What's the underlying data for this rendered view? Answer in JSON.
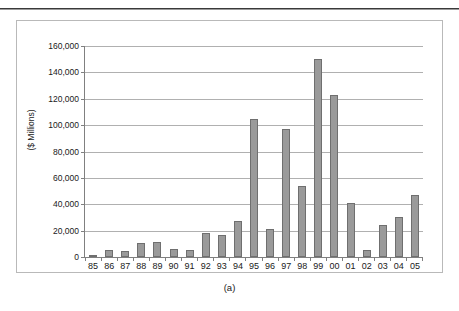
{
  "caption": "(a)",
  "chart_data": {
    "type": "bar",
    "title": "",
    "subtitle": "",
    "xlabel": "",
    "ylabel": "($ Millions)",
    "categories": [
      "85",
      "86",
      "87",
      "88",
      "89",
      "90",
      "91",
      "92",
      "93",
      "94",
      "95",
      "96",
      "97",
      "98",
      "99",
      "00",
      "01",
      "02",
      "03",
      "04",
      "05"
    ],
    "values": [
      1800,
      5500,
      4800,
      10700,
      11200,
      6000,
      5000,
      18000,
      17000,
      27500,
      104500,
      21000,
      97000,
      53500,
      150500,
      123000,
      41000,
      5500,
      24000,
      30500,
      47000
    ],
    "series": [
      {
        "name": "",
        "values": [
          1800,
          5500,
          4800,
          10700,
          11200,
          6000,
          5000,
          18000,
          17000,
          27500,
          104500,
          21000,
          97000,
          53500,
          150500,
          123000,
          41000,
          5500,
          24000,
          30500,
          47000
        ]
      }
    ],
    "ylim": [
      0,
      160000
    ],
    "ytick_values": [
      0,
      20000,
      40000,
      60000,
      80000,
      100000,
      120000,
      140000,
      160000
    ],
    "ytick_labels": [
      "0",
      "20,000",
      "40,000",
      "60,000",
      "80,000",
      "100,000",
      "120,000",
      "140,000",
      "160,000"
    ],
    "grid": true,
    "grid_axis": "y",
    "legend": false,
    "legend_position": "none",
    "bar_fill_color": "#9a9a9a",
    "bar_edge_color": "#6f6f6f",
    "gridline_color": "#b0b0b0",
    "axis_color": "#808080",
    "frame_color": "#b9b9b9",
    "background_color": "#ffffff"
  }
}
